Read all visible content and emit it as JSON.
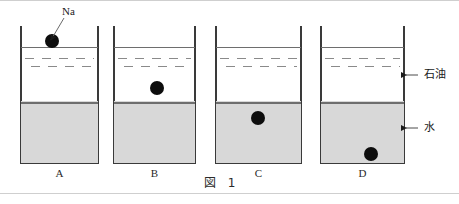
{
  "figure": {
    "caption": "図 1",
    "na_label": "Na",
    "side_labels": {
      "oil": "石油",
      "water": "水"
    },
    "colors": {
      "wall": "#3a3a3a",
      "water_fill": "#d8d8d8",
      "surface_line": "#6e6e6e",
      "oil_dash": "#8a8a8a",
      "pellet": "#0d0d0d",
      "background": "#ffffff"
    },
    "beakers": [
      {
        "id": "A",
        "caption": "A",
        "pellet_position": "above-oil-surface",
        "pellet_x": 52,
        "pellet_y": 41,
        "pellet_r": 7
      },
      {
        "id": "B",
        "caption": "B",
        "pellet_position": "in-oil-above-water",
        "pellet_x": 157,
        "pellet_y": 88,
        "pellet_r": 7
      },
      {
        "id": "C",
        "caption": "C",
        "pellet_position": "in-water-near-top",
        "pellet_x": 258,
        "pellet_y": 118,
        "pellet_r": 7
      },
      {
        "id": "D",
        "caption": "D",
        "pellet_position": "in-water-at-bottom",
        "pellet_x": 371,
        "pellet_y": 154,
        "pellet_r": 7
      }
    ]
  }
}
